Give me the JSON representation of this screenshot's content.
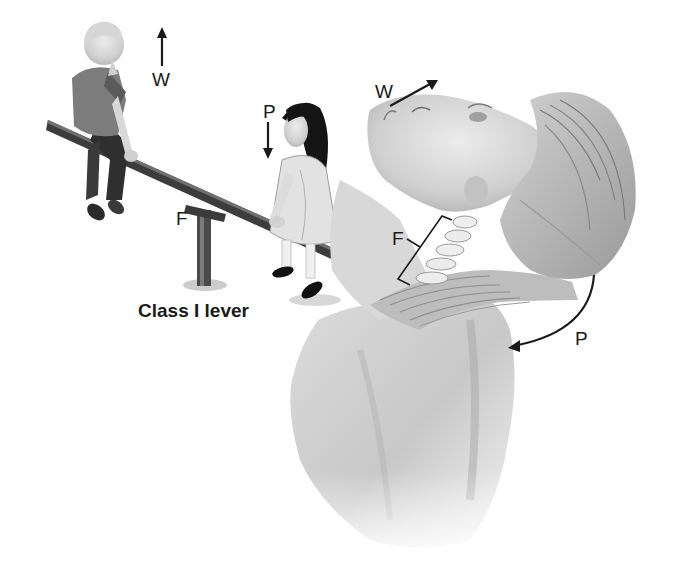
{
  "figure": {
    "caption": "Class I lever",
    "panels": [
      {
        "name": "seesaw",
        "description": "Two children on a seesaw illustrating a Class I lever",
        "labels": {
          "weight": "W",
          "power": "P",
          "fulcrum": "F"
        },
        "arrows": {
          "weight": "arrow-up",
          "power": "arrow-down"
        }
      },
      {
        "name": "head-neck",
        "description": "Head tilted back on cervical spine, neck muscles acting as Class I lever",
        "labels": {
          "weight": "W",
          "power": "P",
          "fulcrum": "F"
        },
        "arrows": {
          "weight": "arrow-up-right",
          "power": "curved-arrow-down-left"
        }
      }
    ]
  },
  "colors": {
    "background": "#ffffff",
    "ink": "#1a1a1a",
    "skin_light": "#e4e4e4",
    "skin_mid": "#c4c4c4",
    "shadow": "#8a8a8a",
    "dark": "#2e2e2e"
  }
}
